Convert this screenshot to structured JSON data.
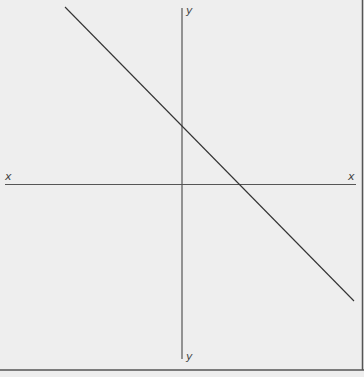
{
  "diagram": {
    "type": "coordinate-plane-with-line",
    "axes": {
      "x_label_left": "x",
      "x_label_right": "x",
      "y_label_top": "y",
      "y_label_bottom": "y"
    },
    "line": {
      "description": "straight line with negative slope",
      "y_intercept_position": "above origin on y-axis",
      "x_intercept_position": "right of origin on x-axis"
    },
    "colors": {
      "background": "#eeeeee",
      "axis": "#555555",
      "line": "#333333",
      "border": "#555555"
    }
  }
}
